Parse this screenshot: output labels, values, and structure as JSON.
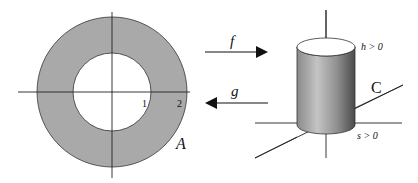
{
  "figure": {
    "left_panel": {
      "region_label": "A",
      "tick_labels": [
        "1",
        "2"
      ],
      "colors": {
        "annulus_fill": "#a9a9a9",
        "inner_fill": "#ffffff",
        "stroke": "#333333"
      }
    },
    "arrows": {
      "forward": {
        "label": "f",
        "direction": "right"
      },
      "backward": {
        "label": "g",
        "direction": "left"
      }
    },
    "right_panel": {
      "region_label": "C",
      "top_label": "h > 0",
      "bottom_label": "s > 0"
    }
  }
}
